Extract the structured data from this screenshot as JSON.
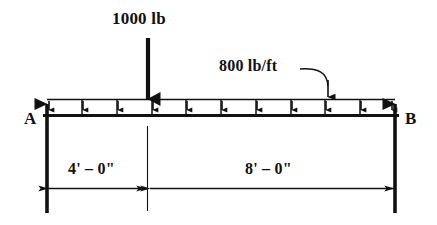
{
  "diagram": {
    "type": "beam-free-body-diagram",
    "colors": {
      "ink": "#111111",
      "background": "#ffffff"
    },
    "labels": {
      "point_load": "1000 lb",
      "distributed_load": "800 lb/ft",
      "support_a": "A",
      "support_b": "B",
      "dimension_left": "4' – 0\"",
      "dimension_right": "8' – 0\""
    },
    "beam": {
      "left_x": 47,
      "right_x": 395,
      "band_top_y": 99,
      "beam_line_y": 115,
      "distributed_arrow_count": 11,
      "divider_count": 9
    },
    "point_load": {
      "x": 148,
      "tip_y": 99,
      "tail_y": 38
    },
    "supports": [
      {
        "name": "A",
        "x": 47,
        "reaction": "upward"
      },
      {
        "name": "B",
        "x": 395,
        "reaction": "upward"
      }
    ],
    "dimensions": [
      {
        "label": "4' – 0\"",
        "from_x": 47,
        "to_x": 147,
        "y": 188
      },
      {
        "label": "8' – 0\"",
        "from_x": 149,
        "to_x": 395,
        "y": 188
      }
    ]
  }
}
